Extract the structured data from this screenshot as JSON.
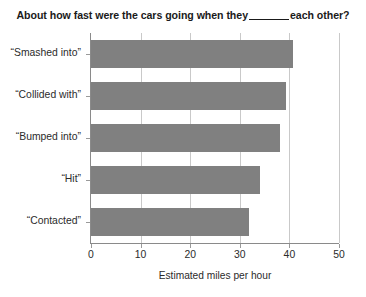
{
  "chart_data": {
    "type": "bar",
    "orientation": "horizontal",
    "title_parts": {
      "before_blank": "About how fast were the cars going when they",
      "after_blank": "each other?"
    },
    "categories": [
      "“Smashed into”",
      "“Collided with”",
      "“Bumped into”",
      "“Hit”",
      "“Contacted”"
    ],
    "values": [
      40.8,
      39.3,
      38.1,
      34.0,
      31.8
    ],
    "xlabel": "Estimated miles per hour",
    "ylabel": "",
    "xlim": [
      0,
      50
    ],
    "xticks": [
      0,
      10,
      20,
      30,
      40,
      50
    ],
    "xtick_labels": [
      "0",
      "10",
      "20",
      "30",
      "40",
      "50"
    ],
    "grid": "vertical",
    "legend": "none",
    "bar_color": "#808080",
    "gridline_color": "#c9c9c9",
    "axis_color": "#8a8a8a",
    "background": "#ffffff"
  }
}
